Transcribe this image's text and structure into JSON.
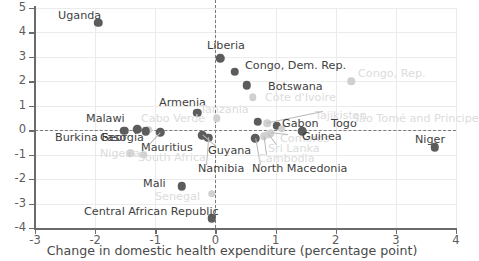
{
  "chart_data": {
    "type": "scatter",
    "title": "",
    "xlabel": "Change in domestic health expenditure (percentage point)",
    "ylabel": "",
    "xlim": [
      -3,
      4
    ],
    "ylim": [
      -4,
      5
    ],
    "xticks": [
      -3,
      -2,
      -1,
      0,
      1,
      2,
      3,
      4
    ],
    "yticks": [
      -4,
      -3,
      -2,
      -1,
      0,
      1,
      2,
      3,
      4,
      5
    ],
    "grid": true,
    "reference_lines": {
      "horizontal": 0,
      "vertical": 0,
      "style": "dashed"
    },
    "legend": "none",
    "points": [
      {
        "label": "Uganda",
        "x": -1.95,
        "y": 4.4,
        "tone": "dark",
        "lx": 58,
        "ly": 10,
        "leader": false
      },
      {
        "label": "Liberia",
        "x": 0.08,
        "y": 2.95,
        "tone": "dark",
        "lx": 207,
        "ly": 40,
        "leader": false
      },
      {
        "label": "Congo, Dem. Rep.",
        "x": 0.32,
        "y": 2.4,
        "tone": "dark",
        "lx": 245,
        "ly": 60,
        "leader": false
      },
      {
        "label": "Congo, Rep.",
        "x": 2.26,
        "y": 2.0,
        "tone": "light",
        "lx": 358,
        "ly": 68,
        "leader": false
      },
      {
        "label": "Botswana",
        "x": 0.52,
        "y": 1.85,
        "tone": "dark",
        "lx": 268,
        "ly": 81,
        "leader": false
      },
      {
        "label": "Côte d'Ivoire",
        "x": 0.62,
        "y": 1.35,
        "tone": "light",
        "lx": 265,
        "ly": 92,
        "leader": false
      },
      {
        "label": "Armenia",
        "x": -0.3,
        "y": 0.72,
        "tone": "dark",
        "lx": 159,
        "ly": 97,
        "leader": false
      },
      {
        "label": "Tanzania",
        "x": 0.02,
        "y": 0.48,
        "tone": "light",
        "lx": 200,
        "ly": 104,
        "leader": false
      },
      {
        "label": "Tajikistan",
        "x": 0.86,
        "y": 0.28,
        "tone": "light",
        "lx": 315,
        "ly": 110,
        "leader": true
      },
      {
        "label": "Gabon",
        "x": 0.7,
        "y": 0.35,
        "tone": "dark",
        "lx": 282,
        "ly": 118,
        "leader": false
      },
      {
        "label": "Togo",
        "x": 1.02,
        "y": 0.18,
        "tone": "dark",
        "lx": 331,
        "ly": 118,
        "leader": false
      },
      {
        "label": "São Tomé and Principe",
        "x": 1.1,
        "y": 0.06,
        "tone": "light",
        "lx": 352,
        "ly": 113,
        "leader": false
      },
      {
        "label": "Malawi",
        "x": -1.3,
        "y": 0.05,
        "tone": "dark",
        "lx": 86,
        "ly": 113,
        "leader": false
      },
      {
        "label": "Cabo Verde",
        "x": -1.12,
        "y": 0.02,
        "tone": "light",
        "lx": 141,
        "ly": 113,
        "leader": false
      },
      {
        "label": "Burkina Faso",
        "x": -1.52,
        "y": -0.02,
        "tone": "dark",
        "lx": 55,
        "ly": 132,
        "leader": false
      },
      {
        "label": "Georgia",
        "x": -1.16,
        "y": -0.05,
        "tone": "dark",
        "lx": 100,
        "ly": 132,
        "leader": false
      },
      {
        "label": "Mauritius",
        "x": -0.92,
        "y": -0.08,
        "tone": "dark",
        "lx": 141,
        "ly": 142,
        "leader": true
      },
      {
        "label": "Nigeria",
        "x": -1.42,
        "y": -0.95,
        "tone": "light",
        "lx": 100,
        "ly": 148,
        "leader": false
      },
      {
        "label": "South Africa",
        "x": -1.2,
        "y": -1.0,
        "tone": "light",
        "lx": 138,
        "ly": 152,
        "leader": false
      },
      {
        "label": "Guyana",
        "x": -0.22,
        "y": -0.2,
        "tone": "dark",
        "lx": 208,
        "ly": 145,
        "leader": true
      },
      {
        "label": "Namibia",
        "x": -0.12,
        "y": -0.3,
        "tone": "dark",
        "lx": 198,
        "ly": 163,
        "leader": true
      },
      {
        "label": "North Macedonia",
        "x": 0.66,
        "y": -0.32,
        "tone": "dark",
        "lx": 252,
        "ly": 163,
        "leader": true
      },
      {
        "label": "Comoros",
        "x": 0.92,
        "y": -0.12,
        "tone": "light",
        "lx": 280,
        "ly": 133,
        "leader": true
      },
      {
        "label": "Sri Lanka",
        "x": 0.88,
        "y": -0.18,
        "tone": "light",
        "lx": 268,
        "ly": 143,
        "leader": true
      },
      {
        "label": "Cambodia",
        "x": 0.8,
        "y": -0.25,
        "tone": "light",
        "lx": 258,
        "ly": 153,
        "leader": true
      },
      {
        "label": "Guinea",
        "x": 1.44,
        "y": -0.05,
        "tone": "dark",
        "lx": 302,
        "ly": 131,
        "leader": false
      },
      {
        "label": "Niger",
        "x": 3.65,
        "y": -0.7,
        "tone": "dark",
        "lx": 415,
        "ly": 134,
        "leader": false
      },
      {
        "label": "Mali",
        "x": -0.56,
        "y": -2.3,
        "tone": "dark",
        "lx": 143,
        "ly": 178,
        "leader": false
      },
      {
        "label": "Senegal",
        "x": -0.06,
        "y": -2.6,
        "tone": "light",
        "lx": 155,
        "ly": 191,
        "leader": false
      },
      {
        "label": "Central African Republic",
        "x": -0.06,
        "y": -3.6,
        "tone": "dark",
        "lx": 84,
        "ly": 206,
        "leader": false
      }
    ]
  },
  "axis": {
    "x_title": "Change in domestic health expenditure (percentage point)"
  }
}
